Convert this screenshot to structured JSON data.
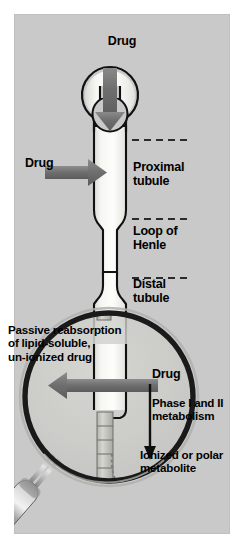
{
  "figure": {
    "type": "diagram",
    "panel_color": "#c9c9c9",
    "background_color": "#ffffff",
    "arrow_color": "#707070",
    "tubule_color": "#f2f2ef",
    "outline_color": "#111111"
  },
  "labels": {
    "drug_top": "Drug",
    "drug_left": "Drug",
    "proximal_tubule": "Proximal\ntubule",
    "loop_of_henle": "Loop of\nHenle",
    "distal_tubule": "Distal\ntubule",
    "passive_reabsorption": "Passive reabsorption\nof lipid-soluble,\nun-ionized drug",
    "drug_bottom": "Drug",
    "phase_metabolism": "Phase I and II\nmetabolism",
    "ionized_metabolite": "Ionized or polar\nmetabolite"
  },
  "structures": {
    "glomerulus": "glomerulus-ring",
    "proximal_segment": "proximal-tubule-segment",
    "loop_segment": "loop-of-henle-segment",
    "distal_segment": "distal-tubule-segment",
    "collecting_duct": "segmented-collecting-duct",
    "magnifier": "magnifying-glass",
    "recycle_arrow": "dashed-curved-arrow"
  },
  "arrows": {
    "filtration_down": "down-arrow-into-glomerulus",
    "secretion_right": "right-arrow-into-proximal-tubule",
    "reabsorption_left": "left-arrow-out-of-collecting-duct",
    "metabolism_down": "thin-down-arrow-metabolism"
  }
}
